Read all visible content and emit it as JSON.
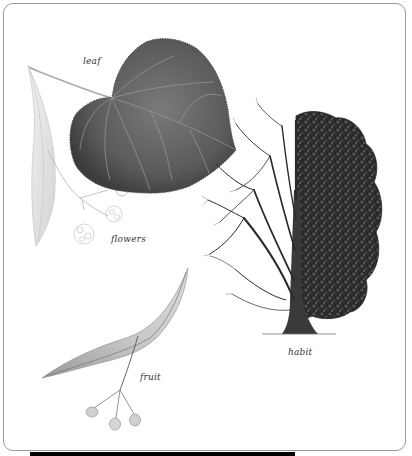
{
  "figure": {
    "labels": {
      "leaf": "leaf",
      "flowers": "flowers",
      "habit": "habit",
      "fruit": "fruit"
    },
    "colors": {
      "frame_border": "#9a9a9a",
      "leaf_fill": "#5f5f5f",
      "bract_fill": "#e6e6e6",
      "tree_dark": "#2b2b2b",
      "bottom_bar": "#000000"
    }
  }
}
